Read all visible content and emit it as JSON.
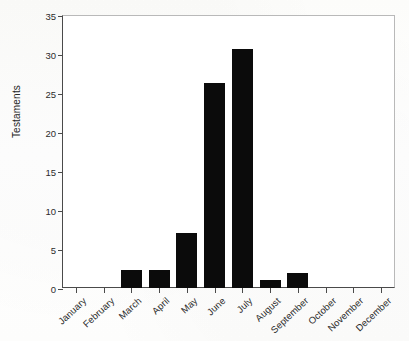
{
  "chart_data": {
    "type": "bar",
    "title": "",
    "xlabel": "",
    "ylabel": "Testaments",
    "categories": [
      "January",
      "February",
      "March",
      "April",
      "May",
      "June",
      "July",
      "August",
      "September",
      "October",
      "November",
      "December"
    ],
    "values": [
      0,
      0,
      2.3,
      2.3,
      7.0,
      26.3,
      30.7,
      1.0,
      1.9,
      0,
      0,
      0
    ],
    "ylim": [
      0,
      35
    ],
    "ytick_labels": [
      "0",
      "5",
      "10",
      "15",
      "20",
      "25",
      "30",
      "35"
    ],
    "ytick_values": [
      0,
      5,
      10,
      15,
      20,
      25,
      30,
      35
    ],
    "grid": false,
    "legend": false,
    "legend_position": "none",
    "bar_color": "#0b0b0b",
    "axis_color": "#4a4a4a",
    "background_color": "#ffffff"
  }
}
